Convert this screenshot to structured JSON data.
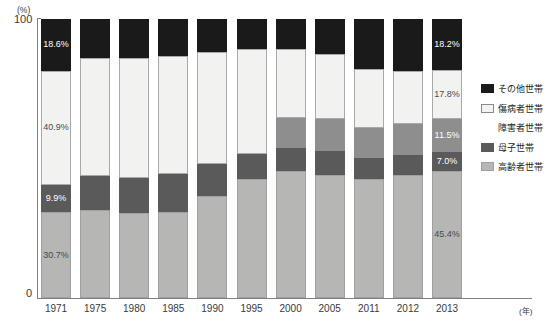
{
  "chart_data": {
    "type": "bar",
    "title": "",
    "subtitle": "",
    "xlabel": "(年)",
    "ylabel": "(%)",
    "ylim": [
      0,
      100
    ],
    "ytick_labels": [
      "100",
      "0"
    ],
    "grid": false,
    "legend_position": "right",
    "stacked": true,
    "stack_order_bottom_to_top": [
      "高齢者世帯",
      "母子世帯",
      "障害者世帯",
      "傷病者世帯",
      "その他世帯"
    ],
    "categories": [
      "1971",
      "1975",
      "1980",
      "1985",
      "1990",
      "1995",
      "2000",
      "2005",
      "2011",
      "2012",
      "2013"
    ],
    "series": [
      {
        "name": "高齢者世帯",
        "color": "#b6b6b4",
        "values": [
          30.7,
          31.4,
          30.3,
          30.9,
          36.5,
          42.5,
          45.5,
          43.9,
          42.6,
          43.9,
          45.4
        ]
      },
      {
        "name": "母子世帯",
        "color": "#5a5a5a",
        "values": [
          9.9,
          12.5,
          12.8,
          13.4,
          11.6,
          9.2,
          8.4,
          8.7,
          7.4,
          7.2,
          7.0
        ]
      },
      {
        "name": "障害者世帯",
        "color": "#8e8e8e",
        "values": [
          0.0,
          0.0,
          0.0,
          0.0,
          0.0,
          0.0,
          10.5,
          11.4,
          11.1,
          11.3,
          11.5
        ]
      },
      {
        "name": "傷病者世帯",
        "color": "#f2f2f0",
        "values": [
          40.9,
          42.0,
          43.0,
          42.4,
          40.2,
          37.4,
          24.8,
          23.3,
          20.8,
          19.1,
          17.8
        ]
      },
      {
        "name": "その他世帯",
        "color": "#1a1a1a",
        "values": [
          18.6,
          14.1,
          13.9,
          13.3,
          11.7,
          10.9,
          10.8,
          12.7,
          18.1,
          18.5,
          18.2
        ]
      }
    ],
    "point_labels": [
      {
        "category": "1971",
        "series": "その他世帯",
        "text": "18.6%"
      },
      {
        "category": "1971",
        "series": "傷病者世帯",
        "text": "40.9%"
      },
      {
        "category": "1971",
        "series": "母子世帯",
        "text": "9.9%"
      },
      {
        "category": "1971",
        "series": "高齢者世帯",
        "text": "30.7%"
      },
      {
        "category": "2013",
        "series": "その他世帯",
        "text": "18.2%"
      },
      {
        "category": "2013",
        "series": "傷病者世帯",
        "text": "17.8%"
      },
      {
        "category": "2013",
        "series": "障害者世帯",
        "text": "11.5%"
      },
      {
        "category": "2013",
        "series": "母子世帯",
        "text": "7.0%"
      },
      {
        "category": "2013",
        "series": "高齢者世帯",
        "text": "45.4%"
      }
    ]
  },
  "axis": {
    "y_unit": "(%)",
    "y_max_label": "100",
    "y_min_label": "0",
    "x_unit": "(年)"
  },
  "legend": {
    "items": [
      {
        "label": "その他世帯",
        "swatch": "other"
      },
      {
        "label": "傷病者世帯",
        "swatch": "sick"
      },
      {
        "label": "障害者世帯",
        "swatch": "disabled"
      },
      {
        "label": "母子世帯",
        "swatch": "mother"
      },
      {
        "label": "高齢者世帯",
        "swatch": "elder"
      }
    ]
  }
}
